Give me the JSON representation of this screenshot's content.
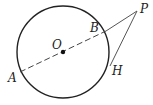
{
  "diagram": {
    "type": "geometry",
    "circle": {
      "center": "O",
      "cx": 63,
      "cy": 52,
      "r": 46
    },
    "points": {
      "O": {
        "label": "O",
        "x": 63,
        "y": 52,
        "label_x": 52,
        "label_y": 49
      },
      "A": {
        "label": "A",
        "x": 20,
        "y": 72,
        "label_x": 8,
        "label_y": 82
      },
      "B": {
        "label": "B",
        "x": 106,
        "y": 31,
        "label_x": 90,
        "label_y": 32
      },
      "P": {
        "label": "P",
        "x": 137,
        "y": 11,
        "label_x": 140,
        "label_y": 13
      },
      "H": {
        "label": "H",
        "x": 110,
        "y": 66,
        "label_x": 112,
        "label_y": 75
      }
    },
    "segments": [
      {
        "from": "A",
        "to": "B",
        "style": "dashed"
      },
      {
        "from": "B",
        "to": "P",
        "style": "solid"
      },
      {
        "from": "P",
        "to": "H",
        "style": "solid"
      }
    ],
    "colors": {
      "stroke": "#222222",
      "background": "#ffffff"
    }
  }
}
